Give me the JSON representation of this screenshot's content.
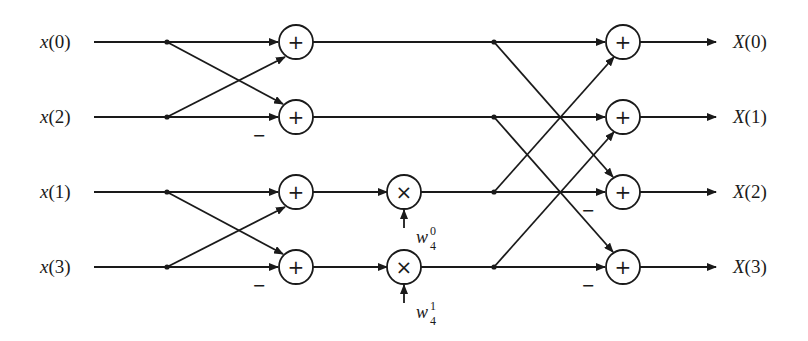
{
  "diagram": {
    "inputs": [
      "x(0)",
      "x(2)",
      "x(1)",
      "x(3)"
    ],
    "input_names": [
      "x",
      "x",
      "x",
      "x"
    ],
    "input_indices": [
      "(0)",
      "(2)",
      "(1)",
      "(3)"
    ],
    "outputs": [
      "X(0)",
      "X(1)",
      "X(2)",
      "X(3)"
    ],
    "output_names": [
      "X",
      "X",
      "X",
      "X"
    ],
    "output_indices": [
      "(0)",
      "(1)",
      "(2)",
      "(3)"
    ],
    "adder_symbol": "+",
    "multiplier_symbol": "×",
    "minus_symbol": "−",
    "twiddles": [
      {
        "base": "w",
        "sub": "4",
        "sup": "0"
      },
      {
        "base": "w",
        "sub": "4",
        "sup": "1"
      }
    ],
    "line_color": "#1a1a1a"
  }
}
